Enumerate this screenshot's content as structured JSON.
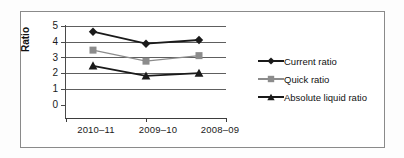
{
  "chart_data": {
    "type": "line",
    "title": "",
    "xlabel": "",
    "ylabel": "Ratio",
    "categories": [
      "2010–11",
      "2009–10",
      "2008–09"
    ],
    "ylim": [
      0,
      5
    ],
    "yticks": [
      "0",
      "1",
      "2",
      "3",
      "4",
      "5"
    ],
    "grid": true,
    "legend_position": "right",
    "series": [
      {
        "name": "Current ratio",
        "marker": "diamond",
        "color": "#1a1a1a",
        "values": [
          4.7,
          4.05,
          4.25
        ]
      },
      {
        "name": "Quick ratio",
        "marker": "square",
        "color": "#8c8c8c",
        "values": [
          3.7,
          3.1,
          3.4
        ]
      },
      {
        "name": "Absolute liquid ratio",
        "marker": "triangle",
        "color": "#1a1a1a",
        "values": [
          2.85,
          2.3,
          2.45
        ]
      }
    ]
  },
  "axis": {
    "y_label": "Ratio",
    "y_ticks": [
      "5",
      "4",
      "3",
      "2",
      "1",
      "0"
    ],
    "x_labels": [
      "2010–11",
      "2009–10",
      "2008–09"
    ]
  },
  "legend": {
    "items": [
      {
        "label": "Current ratio",
        "marker": "diamond-marker-icon"
      },
      {
        "label": "Quick ratio",
        "marker": "square-marker-icon"
      },
      {
        "label": "Absolute liquid ratio",
        "marker": "triangle-marker-icon"
      }
    ]
  },
  "colors": {
    "series_dark": "#1a1a1a",
    "series_gray": "#8c8c8c",
    "grid": "#5e5e5e",
    "frame": "#8a8a8a"
  }
}
